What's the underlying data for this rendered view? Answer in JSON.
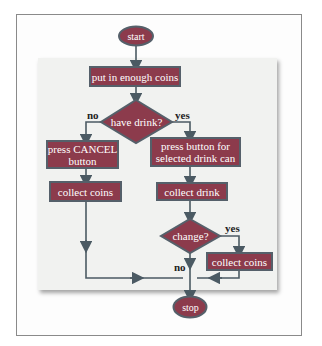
{
  "diagram": {
    "type": "flowchart",
    "colors": {
      "box_fill": "#8c3b4c",
      "box_border": "#55606a",
      "terminal_fill": "#8c3b4c",
      "terminal_border": "#5d6f7b",
      "line": "#4b5a63",
      "panel": "#f1f2f0"
    },
    "nodes": {
      "start": "start",
      "put_coins": "put in enough coins",
      "have_drink": "have drink?",
      "press_cancel": "press CANCEL\nbutton",
      "collect_coins_left": "collect coins",
      "press_button": "press button for\nselected drink can",
      "collect_drink": "collect drink",
      "change": "change?",
      "collect_coins_right": "collect coins",
      "stop": "stop"
    },
    "edge_labels": {
      "have_drink_no": "no",
      "have_drink_yes": "yes",
      "change_yes": "yes",
      "change_no": "no"
    }
  }
}
